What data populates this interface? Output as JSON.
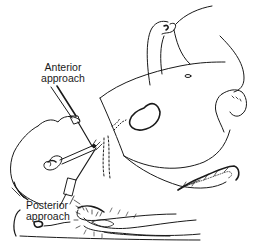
{
  "figure": {
    "type": "medical line illustration",
    "line_color": "#1a1a1a",
    "background_color": "#ffffff"
  },
  "labels": {
    "anterior": {
      "line1": "Anterior",
      "line2": "approach"
    },
    "posterior": {
      "line1": "Posterior",
      "line2": "approach"
    }
  },
  "elements": {
    "anterior_needle": "anterior-needle",
    "posterior_needle": "posterior-needle",
    "head": "head",
    "torso": "torso",
    "arm": "raised-arm",
    "hand": "hand",
    "knee": "knee",
    "drapes": "drapes"
  }
}
